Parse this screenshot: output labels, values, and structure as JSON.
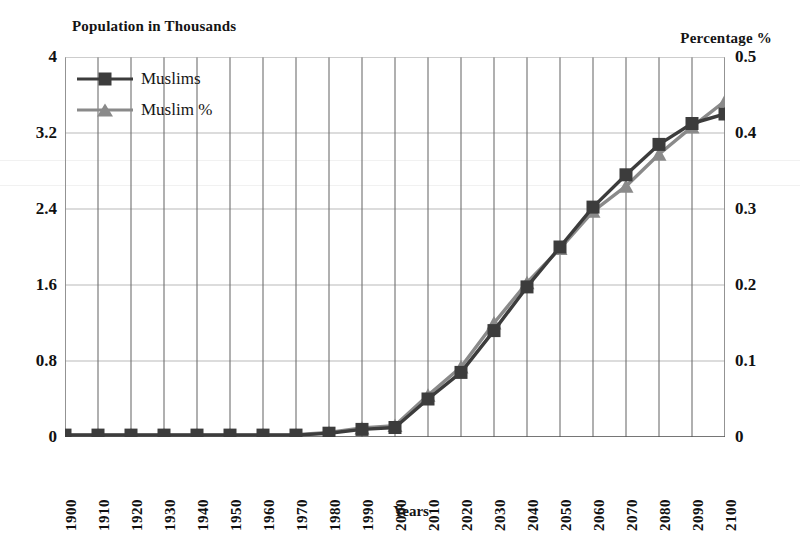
{
  "titles": {
    "left_axis": "Population in Thousands",
    "right_axis": "Percentage %",
    "x_axis": "Years"
  },
  "legend": {
    "position": "top-left-inside",
    "items": [
      {
        "label": "Muslims",
        "marker": "square",
        "color": "#3c3c3c"
      },
      {
        "label": "Muslim %",
        "marker": "triangle",
        "color": "#8a8a8a"
      }
    ]
  },
  "axes": {
    "left_ticks": [
      "0",
      "0.8",
      "1.6",
      "2.4",
      "3.2",
      "4"
    ],
    "right_ticks": [
      "0",
      "0.1",
      "0.2",
      "0.3",
      "0.4",
      "0.5"
    ],
    "x_ticks": [
      "1900",
      "1910",
      "1920",
      "1930",
      "1940",
      "1950",
      "1960",
      "1970",
      "1980",
      "1990",
      "2000",
      "2010",
      "2020",
      "2030",
      "2040",
      "2050",
      "2060",
      "2070",
      "2080",
      "2090",
      "2100"
    ]
  },
  "chart_data": {
    "type": "line",
    "title": "",
    "xlabel": "Years",
    "ylabel": "Population in Thousands",
    "y2label": "Percentage %",
    "grid": true,
    "legend_position": "upper left",
    "x": [
      1900,
      1910,
      1920,
      1930,
      1940,
      1950,
      1960,
      1970,
      1980,
      1990,
      2000,
      2010,
      2020,
      2030,
      2040,
      2050,
      2060,
      2070,
      2080,
      2090,
      2100
    ],
    "ylim": [
      0,
      4
    ],
    "y2lim": [
      0,
      0.5
    ],
    "yticks": [
      0,
      0.8,
      1.6,
      2.4,
      3.2,
      4
    ],
    "y2ticks": [
      0,
      0.1,
      0.2,
      0.3,
      0.4,
      0.5
    ],
    "series": [
      {
        "name": "Muslims",
        "axis": "left",
        "marker": "square",
        "color": "#3c3c3c",
        "units": "thousands",
        "values": [
          0.02,
          0.02,
          0.02,
          0.02,
          0.02,
          0.02,
          0.02,
          0.02,
          0.04,
          0.08,
          0.1,
          0.4,
          0.68,
          1.12,
          1.58,
          2.0,
          2.42,
          2.76,
          3.08,
          3.3,
          3.4
        ]
      },
      {
        "name": "Muslim %",
        "axis": "right",
        "marker": "triangle",
        "color": "#8a8a8a",
        "units": "percent",
        "values": [
          0.003,
          0.003,
          0.003,
          0.003,
          0.003,
          0.003,
          0.003,
          0.003,
          0.006,
          0.012,
          0.015,
          0.055,
          0.092,
          0.15,
          0.203,
          0.248,
          0.297,
          0.33,
          0.372,
          0.408,
          0.442
        ]
      }
    ]
  }
}
